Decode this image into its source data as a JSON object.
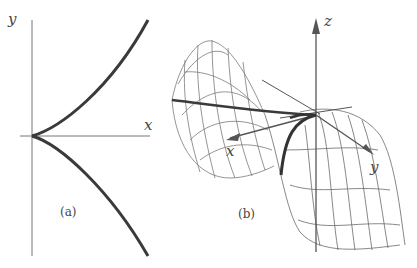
{
  "figure": {
    "panel_a": {
      "caption": "(a)",
      "x_label": "x",
      "y_label": "y",
      "curve": "semicubical cusp (y^2 = x^3)"
    },
    "panel_b": {
      "caption": "(b)",
      "x_label": "x",
      "y_label": "y",
      "z_label": "z",
      "surface": "wireframe saddle-like surface with cusp curve"
    },
    "colors": {
      "axis": "#555555",
      "curve": "#3a3a3a",
      "mesh": "#6a6a6a",
      "background": "#ffffff"
    }
  }
}
